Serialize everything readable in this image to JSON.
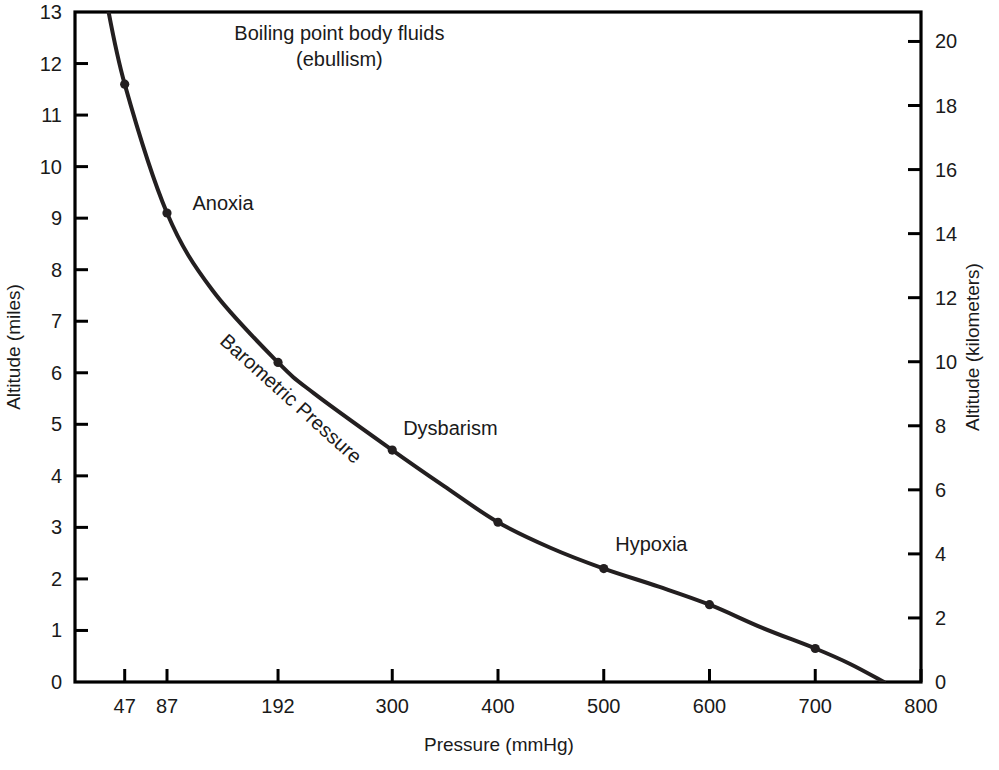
{
  "chart_data": {
    "type": "line",
    "title": "",
    "xlabel": "Pressure (mmHg)",
    "ylabel": "Altitude (miles)",
    "y2label": "Altitude (kilometers)",
    "xlim": [
      0,
      800
    ],
    "ylim": [
      0,
      13
    ],
    "y2lim": [
      0,
      20.92
    ],
    "grid": false,
    "legend": null,
    "xticks": [
      47,
      87,
      192,
      300,
      400,
      500,
      600,
      700,
      800
    ],
    "xtick_labels": [
      "47",
      "87",
      "192",
      "300",
      "400",
      "500",
      "600",
      "700",
      "800"
    ],
    "yticks": [
      0,
      1,
      2,
      3,
      4,
      5,
      6,
      7,
      8,
      9,
      10,
      11,
      12,
      13
    ],
    "ytick_labels": [
      "0",
      "1",
      "2",
      "3",
      "4",
      "5",
      "6",
      "7",
      "8",
      "9",
      "10",
      "11",
      "12",
      "13"
    ],
    "y2ticks": [
      0,
      2,
      4,
      6,
      8,
      10,
      12,
      14,
      16,
      18,
      20
    ],
    "y2tick_labels": [
      "0",
      "2",
      "4",
      "6",
      "8",
      "10",
      "12",
      "14",
      "16",
      "18",
      "20"
    ],
    "series": [
      {
        "name": "Barometric Pressure",
        "x": [
          28,
          47,
          87,
          130,
          192,
          226,
          300,
          349,
          400,
          450,
          500,
          552,
          600,
          650,
          700,
          733,
          765
        ],
        "y": [
          13.4,
          11.6,
          9.1,
          7.6,
          6.2,
          5.6,
          4.5,
          3.8,
          3.1,
          2.6,
          2.2,
          1.85,
          1.5,
          1.05,
          0.65,
          0.35,
          0.0
        ]
      }
    ],
    "markers": [
      {
        "x": 47,
        "y": 11.6
      },
      {
        "x": 87,
        "y": 9.1
      },
      {
        "x": 192,
        "y": 6.2
      },
      {
        "x": 300,
        "y": 4.5
      },
      {
        "x": 400,
        "y": 3.1
      },
      {
        "x": 500,
        "y": 2.2
      },
      {
        "x": 600,
        "y": 1.5
      },
      {
        "x": 700,
        "y": 0.65
      }
    ],
    "annotations": [
      {
        "name": "ebullism",
        "lines": [
          "Boiling point body fluids",
          "(ebullism)"
        ],
        "x": 250,
        "y": 12.45,
        "rotation": 0
      },
      {
        "name": "anoxia",
        "lines": [
          "Anoxia"
        ],
        "x": 140,
        "y": 9.15,
        "rotation": 0
      },
      {
        "name": "barometric-pressure",
        "lines": [
          "Barometric Pressure"
        ],
        "x": 200,
        "y": 5.4,
        "rotation": 42
      },
      {
        "name": "dysbarism",
        "lines": [
          "Dysbarism"
        ],
        "x": 355,
        "y": 4.8,
        "rotation": 0
      },
      {
        "name": "hypoxia",
        "lines": [
          "Hypoxia"
        ],
        "x": 545,
        "y": 2.55,
        "rotation": 0
      }
    ],
    "colors": {
      "curve": "#231f20",
      "axis": "#000000",
      "text": "#1a1a1a",
      "background": "#ffffff",
      "marker": "#231f20"
    }
  }
}
